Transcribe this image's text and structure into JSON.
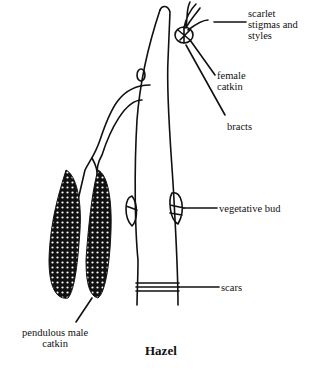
{
  "diagram": {
    "caption": "Hazel",
    "labels": {
      "stigmas": "scarlet\nstigmas and\nstyles",
      "female_catkin": "female\ncatkin",
      "bracts": "bracts",
      "vegetative_bud": "vegetative bud",
      "scars": "scars",
      "male_catkin": "pendulous male\ncatkin"
    }
  }
}
